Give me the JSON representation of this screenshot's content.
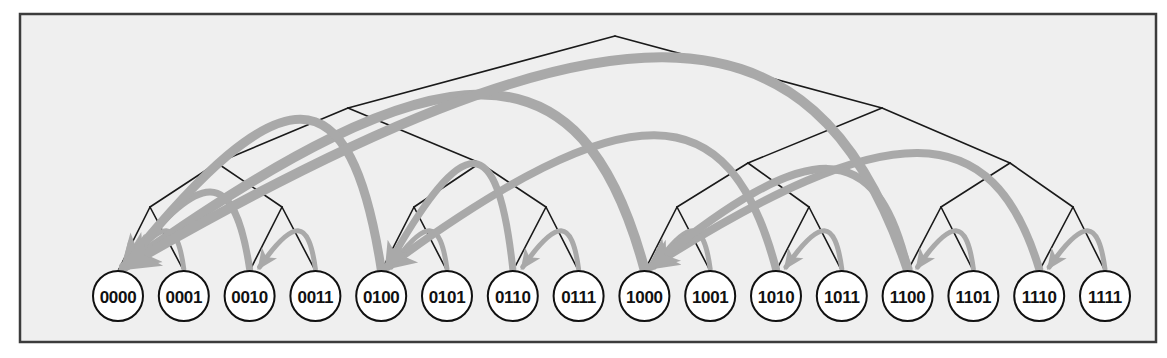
{
  "figure": {
    "name": "bit-reversal-permutation-tree",
    "width": 1167,
    "height": 358
  },
  "colors": {
    "page_background": "#ffffff",
    "panel_background": "#efefef",
    "panel_border": "#3c3c3c",
    "tree_edge": "#1a1a1a",
    "node_stroke": "#111111",
    "node_fill": "#ffffff",
    "node_text": "#111111",
    "arrow": "#a9a9a9"
  },
  "panel": {
    "x": 20,
    "y": 14,
    "width": 1136,
    "height": 328,
    "border_width": 2.5
  },
  "tree": {
    "depth": 4,
    "root": {
      "x": 615,
      "y": 36
    },
    "level_y": [
      36,
      108,
      163,
      207,
      270
    ],
    "leaf_y": 296,
    "leaf_radius": 25,
    "leaf_start_x": 118,
    "leaf_spacing": 65.8,
    "edge_width": 1.6
  },
  "leaves": [
    {
      "index": 0,
      "label": "0000",
      "cx": 118,
      "cy": 296
    },
    {
      "index": 1,
      "label": "0001",
      "cx": 183.8,
      "cy": 296
    },
    {
      "index": 2,
      "label": "0010",
      "cx": 249.6,
      "cy": 296
    },
    {
      "index": 3,
      "label": "0011",
      "cx": 315.4,
      "cy": 296
    },
    {
      "index": 4,
      "label": "0100",
      "cx": 381.2,
      "cy": 296
    },
    {
      "index": 5,
      "label": "0101",
      "cx": 447.0,
      "cy": 296
    },
    {
      "index": 6,
      "label": "0110",
      "cx": 512.8,
      "cy": 296
    },
    {
      "index": 7,
      "label": "0111",
      "cx": 578.6,
      "cy": 296
    },
    {
      "index": 8,
      "label": "1000",
      "cx": 644.4,
      "cy": 296
    },
    {
      "index": 9,
      "label": "1001",
      "cx": 710.2,
      "cy": 296
    },
    {
      "index": 10,
      "label": "1010",
      "cx": 776.0,
      "cy": 296
    },
    {
      "index": 11,
      "label": "1011",
      "cx": 841.8,
      "cy": 296
    },
    {
      "index": 12,
      "label": "1100",
      "cx": 907.6,
      "cy": 296
    },
    {
      "index": 13,
      "label": "1101",
      "cx": 973.4,
      "cy": 296
    },
    {
      "index": 14,
      "label": "1110",
      "cx": 1039.2,
      "cy": 296
    },
    {
      "index": 15,
      "label": "1111",
      "cx": 1105.0,
      "cy": 296
    }
  ],
  "internal_nodes": [
    {
      "id": "root",
      "level": 0,
      "x": 615,
      "y": 36
    },
    {
      "id": "L0",
      "level": 1,
      "x": 348,
      "y": 108
    },
    {
      "id": "L1",
      "level": 1,
      "x": 882,
      "y": 108
    },
    {
      "id": "L00",
      "level": 2,
      "x": 217,
      "y": 163
    },
    {
      "id": "L01",
      "level": 2,
      "x": 480,
      "y": 163
    },
    {
      "id": "L10",
      "level": 2,
      "x": 748,
      "y": 163
    },
    {
      "id": "L11",
      "level": 2,
      "x": 1010,
      "y": 163
    },
    {
      "id": "L000",
      "level": 3,
      "x": 150,
      "y": 207
    },
    {
      "id": "L001",
      "level": 3,
      "x": 282,
      "y": 207
    },
    {
      "id": "L010",
      "level": 3,
      "x": 414,
      "y": 207
    },
    {
      "id": "L011",
      "level": 3,
      "x": 546,
      "y": 207
    },
    {
      "id": "L100",
      "level": 3,
      "x": 677,
      "y": 207
    },
    {
      "id": "L101",
      "level": 3,
      "x": 809,
      "y": 207
    },
    {
      "id": "L110",
      "level": 3,
      "x": 941,
      "y": 207
    },
    {
      "id": "L111",
      "level": 3,
      "x": 1073,
      "y": 207
    }
  ],
  "arrows": {
    "legend": "Each arrow runs from the source index to its bit-reversed destination index",
    "items": [
      {
        "from_label": "1111",
        "from": 15,
        "to_label": "1110",
        "to": 14,
        "width": 5,
        "apex_lift": 42
      },
      {
        "from_label": "1101",
        "from": 13,
        "to_label": "1100",
        "to": 12,
        "width": 5,
        "apex_lift": 42
      },
      {
        "from_label": "1011",
        "from": 11,
        "to_label": "1010",
        "to": 10,
        "width": 5,
        "apex_lift": 42
      },
      {
        "from_label": "1001",
        "from": 9,
        "to_label": "1000",
        "to": 8,
        "width": 5,
        "apex_lift": 42
      },
      {
        "from_label": "0111",
        "from": 7,
        "to_label": "0110",
        "to": 6,
        "width": 5,
        "apex_lift": 42
      },
      {
        "from_label": "0101",
        "from": 5,
        "to_label": "0100",
        "to": 4,
        "width": 5,
        "apex_lift": 42
      },
      {
        "from_label": "0011",
        "from": 3,
        "to_label": "0010",
        "to": 2,
        "width": 5,
        "apex_lift": 42
      },
      {
        "from_label": "0001",
        "from": 1,
        "to_label": "0000",
        "to": 0,
        "width": 5,
        "apex_lift": 42
      },
      {
        "from_label": "1110",
        "from": 14,
        "to_label": "1000",
        "to": 8,
        "width": 8,
        "apex_lift": 130
      },
      {
        "from_label": "1100",
        "from": 12,
        "to_label": "1000",
        "to": 8,
        "width": 8,
        "apex_lift": 112
      },
      {
        "from_label": "1010",
        "from": 10,
        "to_label": "0100",
        "to": 4,
        "width": 8,
        "apex_lift": 150
      },
      {
        "from_label": "0110",
        "from": 6,
        "to_label": "0100",
        "to": 4,
        "width": 7,
        "apex_lift": 118
      },
      {
        "from_label": "0010",
        "from": 2,
        "to_label": "0000",
        "to": 0,
        "width": 7,
        "apex_lift": 86
      },
      {
        "from_label": "1000",
        "from": 8,
        "to_label": "0000",
        "to": 0,
        "width": 10,
        "apex_lift": 196
      },
      {
        "from_label": "0100",
        "from": 4,
        "to_label": "0000",
        "to": 0,
        "width": 9,
        "apex_lift": 168
      },
      {
        "from_label": "1100",
        "from": 12,
        "to_label": "0000",
        "to": 0,
        "width": 10,
        "apex_lift": 238
      }
    ]
  }
}
